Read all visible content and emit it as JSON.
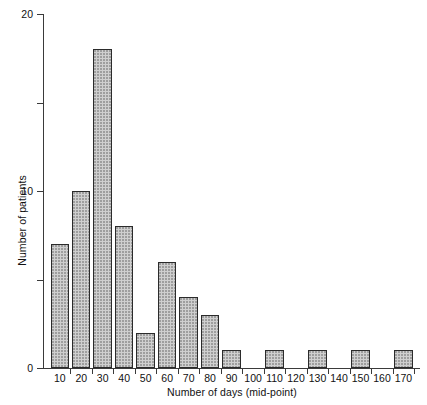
{
  "chart_data": {
    "type": "bar",
    "title": "",
    "subtitle": "",
    "xlabel": "Number of days (mid-point)",
    "ylabel": "Number of patients",
    "categories": [
      "10",
      "20",
      "30",
      "40",
      "50",
      "60",
      "70",
      "80",
      "90",
      "100",
      "110",
      "120",
      "130",
      "140",
      "150",
      "160",
      "170"
    ],
    "values": [
      7,
      10,
      18,
      8,
      2,
      6,
      4,
      3,
      1,
      0,
      1,
      0,
      1,
      0,
      1,
      0,
      1
    ],
    "xlim": [
      5,
      175
    ],
    "ylim": [
      0,
      20
    ],
    "yticks": [
      0,
      5,
      10,
      15,
      20
    ],
    "ytick_labels": [
      "0",
      "",
      "10",
      "",
      "20"
    ],
    "xticks": [
      "10",
      "20",
      "30",
      "40",
      "50",
      "60",
      "70",
      "80",
      "90",
      "100",
      "110",
      "120",
      "130",
      "140",
      "150",
      "160",
      "170"
    ],
    "grid": false,
    "legend": null,
    "legend_position": "none",
    "bar_fill_color": "#cfcfcf",
    "bar_edge_color": "#2b2b2b",
    "axis_color": "#3a3a3a",
    "background_color": "#ffffff"
  }
}
